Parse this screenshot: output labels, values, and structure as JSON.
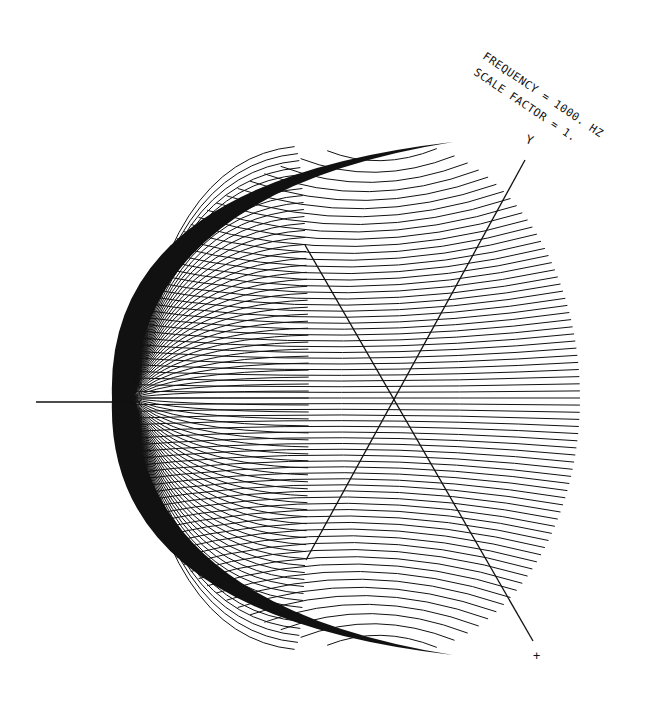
{
  "chart_data": {
    "type": "surface-wireframe",
    "title": "",
    "annotations": [
      {
        "text": "FREQUENCY = 1000. HZ",
        "x": 482,
        "y": 58,
        "rotate": 34
      },
      {
        "text": "SCALE FACTOR = 1.",
        "x": 473,
        "y": 74,
        "rotate": 34
      }
    ],
    "frequency_hz": 1000,
    "scale_factor": 1,
    "axes": [
      {
        "name": "Y",
        "label": "Y",
        "from": [
          306,
          560
        ],
        "to": [
          525,
          160
        ],
        "label_pos": [
          530,
          140
        ]
      },
      {
        "name": "X",
        "label": "+",
        "from": [
          305,
          245
        ],
        "to": [
          533,
          641
        ],
        "label_pos": [
          538,
          656
        ]
      },
      {
        "name": "Z",
        "label": "",
        "from": [
          36,
          402
        ],
        "to": [
          140,
          402
        ],
        "label_pos": null
      }
    ],
    "origin": [
      393,
      398
    ],
    "surface": {
      "shape": "hemisphere-like radiation pattern",
      "center": [
        393,
        398
      ],
      "extent": {
        "left": 112,
        "right": 580,
        "top": 142,
        "bottom": 655
      },
      "meridian_count": 36,
      "parallel_count": 36,
      "line_color": "#111111",
      "background": "#ffffff"
    },
    "xlabel": "X",
    "ylabel": "Y",
    "grid": false,
    "legend": null
  },
  "labels": {
    "frequency": "FREQUENCY = 1000. HZ",
    "scale": "SCALE FACTOR = 1.",
    "y_axis": "Y",
    "x_axis": "+"
  }
}
